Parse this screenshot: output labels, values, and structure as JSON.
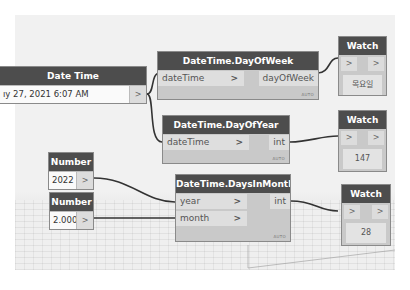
{
  "nodes": {
    "date_time": {
      "title": "Date Time",
      "value": "ıy 27, 2021 6:07 AM",
      "out_port": ">"
    },
    "day_of_week": {
      "title": "DateTime.DayOfWeek",
      "inputs": [
        {
          "label": "dateTime",
          "arrow": ">"
        }
      ],
      "output": "dayOfWeek",
      "lacing": "AUTO"
    },
    "day_of_year": {
      "title": "DateTime.DayOfYear",
      "inputs": [
        {
          "label": "dateTime",
          "arrow": ">"
        }
      ],
      "output": "int",
      "lacing": "AUTO"
    },
    "days_in_month": {
      "title": "DateTime.DaysInMonth",
      "inputs": [
        {
          "label": "year",
          "arrow": ">"
        },
        {
          "label": "month",
          "arrow": ">"
        }
      ],
      "output": "int",
      "lacing": "AUTO"
    },
    "number_year": {
      "title": "Number",
      "value": "2022",
      "out_port": ">"
    },
    "number_month": {
      "title": "Number",
      "value": "2.000",
      "out_port": ">"
    },
    "watch_1": {
      "title": "Watch",
      "in_port": ">",
      "out_port": ">",
      "result": "목요일"
    },
    "watch_2": {
      "title": "Watch",
      "in_port": ">",
      "out_port": ">",
      "result": "147"
    },
    "watch_3": {
      "title": "Watch",
      "in_port": ">",
      "out_port": ">",
      "result": "28"
    }
  },
  "colors": {
    "canvas": "#f1f1f1",
    "node_header": "#4d4d4d",
    "node_body": "#c9c9c9",
    "wire": "#333333"
  }
}
